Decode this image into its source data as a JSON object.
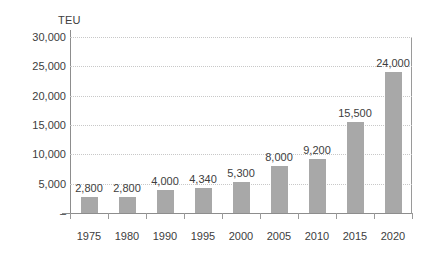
{
  "chart_data": {
    "type": "bar",
    "title": "",
    "subtitle": "",
    "xlabel": "",
    "ylabel": "TEU",
    "categories": [
      "1975",
      "1980",
      "1990",
      "1995",
      "2000",
      "2005",
      "2010",
      "2015",
      "2020"
    ],
    "values": [
      2800,
      2800,
      4000,
      4340,
      5300,
      8000,
      9200,
      15500,
      24000
    ],
    "value_labels": [
      "2,800",
      "2,800",
      "4,000",
      "4,340",
      "5,300",
      "8,000",
      "9,200",
      "15,500",
      "24,000"
    ],
    "ylim": [
      0,
      30000
    ],
    "ytick_values": [
      30000,
      25000,
      20000,
      15000,
      10000,
      5000,
      0
    ],
    "ytick_labels": [
      "30,000",
      "25,000",
      "20,000",
      "15,000",
      "10,000",
      "5,000",
      "–"
    ],
    "grid": true,
    "grid_axis": "y",
    "legend": false,
    "legend_position": "none",
    "bar_color": "#a8a8a8",
    "grid_color": "#c8c8c8",
    "axis_color": "#8d8d8d",
    "text_color": "#3d3d3d",
    "background_color": "#ffffff"
  }
}
